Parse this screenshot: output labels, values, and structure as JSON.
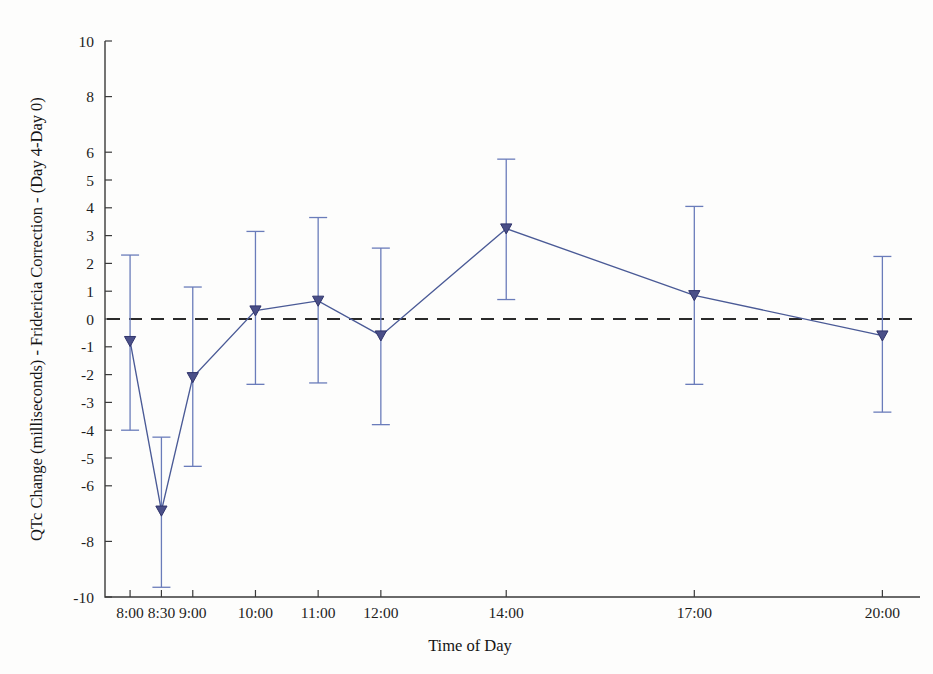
{
  "figure": {
    "width": 933,
    "height": 674,
    "background": "#fdfdfc"
  },
  "colors": {
    "series": "#4a5a96",
    "errorbar": "#6a7cba",
    "marker_fill": "#4a4f88",
    "marker_edge": "#30346b",
    "axis": "#3a3a3a",
    "zero_line": "#2a2a2a",
    "text": "#1a1a1a"
  },
  "chart_data": {
    "type": "line",
    "title": "",
    "xlabel": "Time of Day",
    "ylabel": "QTc Change (milliseconds) - Fridericia Correction - (Day 4-Day 0)",
    "categories": [
      "8:00",
      "8:30",
      "9:00",
      "10:00",
      "11:00",
      "12:00",
      "14:00",
      "17:00",
      "20:00"
    ],
    "x_numeric": [
      8.0,
      8.5,
      9.0,
      10.0,
      11.0,
      12.0,
      14.0,
      17.0,
      20.0
    ],
    "xlim": [
      7.6,
      20.6
    ],
    "ylim": [
      -10,
      10
    ],
    "values": [
      -0.8,
      -6.9,
      -2.1,
      0.3,
      0.65,
      -0.6,
      3.25,
      0.85,
      -0.6
    ],
    "error_low": [
      -4.0,
      -9.65,
      -5.3,
      -2.35,
      -2.3,
      -3.8,
      0.7,
      -2.35,
      -3.35
    ],
    "error_high": [
      2.3,
      -4.25,
      1.15,
      3.15,
      3.65,
      2.55,
      5.75,
      4.05,
      2.25
    ],
    "series": [
      {
        "name": "QTcF change (Day 4 - Day 0)",
        "marker": "triangle-down",
        "values": [
          -0.8,
          -6.9,
          -2.1,
          0.3,
          0.65,
          -0.6,
          3.25,
          0.85,
          -0.6
        ]
      }
    ],
    "y_ticks": [
      10,
      8,
      6,
      5,
      4,
      3,
      2,
      1,
      0,
      -1,
      -2,
      -3,
      -4,
      -5,
      -6,
      -8,
      -10
    ],
    "y_tick_labels": [
      "10",
      "8",
      "6",
      "5",
      "4",
      "3",
      "2",
      "1",
      "0",
      "-1",
      "-2",
      "-3",
      "-4",
      "-5",
      "-6",
      "-8",
      "-10"
    ],
    "x_tick_labels": [
      "8:00",
      "8:30",
      "9:00",
      "10:00",
      "11:00",
      "12:00",
      "14:00",
      "17:00",
      "20:00"
    ],
    "reference_lines": [
      {
        "name": "zero-reference",
        "axis": "y",
        "value": 0,
        "style": "dashed"
      }
    ],
    "grid": false,
    "legend": null,
    "legend_position": "none",
    "errorbar_style": "capped-vertical",
    "annotations": []
  },
  "axes": {
    "y_title": "QTc Change (milliseconds) - Fridericia Correction - (Day 4-Day 0)",
    "x_title": "Time of Day"
  }
}
